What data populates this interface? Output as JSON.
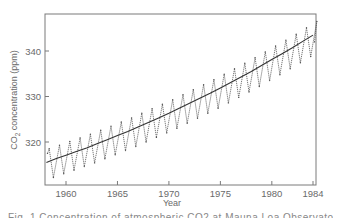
{
  "chart_data": {
    "type": "line",
    "title": "",
    "xlabel": "Year",
    "ylabel": "CO2 concentration (ppm)",
    "ylabel_parts": {
      "main": "CO",
      "sub": "2",
      "rest": " concentration (ppm)"
    },
    "xlim": [
      1958,
      1984.3
    ],
    "ylim": [
      310.5,
      348
    ],
    "grid": false,
    "legend": null,
    "x_ticks": [
      1960,
      1965,
      1970,
      1975,
      1980,
      1984
    ],
    "x_tick_labels": [
      "1960",
      "1965",
      "1970",
      "1975",
      "1980",
      "1984"
    ],
    "y_ticks": [
      320,
      330,
      340
    ],
    "y_tick_labels": [
      "320",
      "330",
      "340"
    ],
    "series": [
      {
        "name": "Monthly CO2 (seasonal cycle)",
        "style": "dotted-line",
        "years": [
          1958,
          1959,
          1960,
          1961,
          1962,
          1963,
          1964,
          1965,
          1966,
          1967,
          1968,
          1969,
          1970,
          1971,
          1972,
          1973,
          1974,
          1975,
          1976,
          1977,
          1978,
          1979,
          1980,
          1981,
          1982,
          1983,
          1984
        ],
        "annual_peak_may": [
          318.5,
          319.3,
          320.1,
          320.9,
          321.7,
          322.6,
          323.5,
          324.4,
          325.3,
          326.3,
          327.3,
          328.3,
          329.3,
          330.4,
          331.5,
          332.6,
          333.7,
          334.9,
          336.1,
          337.3,
          338.5,
          339.8,
          341.1,
          342.4,
          343.7,
          345.1,
          346.5
        ],
        "annual_trough_oct": [
          312.2,
          313.0,
          313.8,
          314.6,
          315.4,
          316.3,
          317.2,
          318.1,
          319.0,
          320.0,
          321.0,
          322.0,
          323.0,
          324.1,
          325.2,
          326.3,
          327.4,
          328.6,
          329.8,
          331.0,
          332.2,
          333.5,
          334.8,
          336.1,
          337.4,
          338.8,
          null
        ]
      },
      {
        "name": "Smoothed trend",
        "style": "solid-line",
        "years": [
          1958,
          1959,
          1960,
          1961,
          1962,
          1963,
          1964,
          1965,
          1966,
          1967,
          1968,
          1969,
          1970,
          1971,
          1972,
          1973,
          1974,
          1975,
          1976,
          1977,
          1978,
          1979,
          1980,
          1981,
          1982,
          1983,
          1984
        ],
        "values": [
          315.5,
          316.3,
          317.1,
          317.9,
          318.7,
          319.6,
          320.5,
          321.4,
          322.3,
          323.3,
          324.3,
          325.3,
          326.3,
          327.4,
          328.5,
          329.6,
          330.7,
          331.9,
          333.1,
          334.3,
          335.5,
          336.8,
          338.1,
          339.4,
          340.7,
          342.1,
          343.5
        ]
      }
    ],
    "colors": {
      "axis": "#7a7a7a",
      "data": "#555555",
      "trend": "#333333",
      "text": "#6a6a6a"
    }
  },
  "caption": "Fig. 1  Concentration of atmospheric CO2 at Mauna Loa Observatory"
}
